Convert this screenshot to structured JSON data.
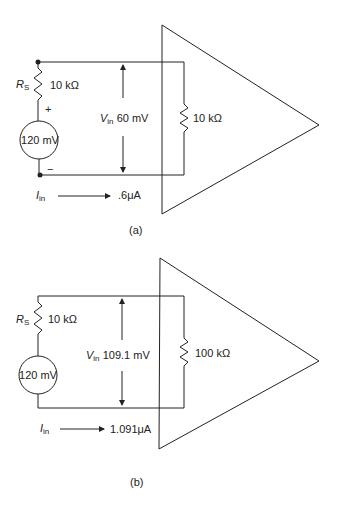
{
  "diagrams": [
    {
      "id": "a",
      "caption": "(a)",
      "source": {
        "label": "120 mV",
        "plus": "+",
        "minus": "−"
      },
      "rs": {
        "symbol": "R",
        "subscript": "S",
        "value": "10 kΩ"
      },
      "vin": {
        "symbol": "V",
        "subscript": "in",
        "value": "60 mV"
      },
      "load": {
        "value": "10 kΩ"
      },
      "iin": {
        "symbol": "I",
        "subscript": "in",
        "value": ".6μA"
      }
    },
    {
      "id": "b",
      "caption": "(b)",
      "source": {
        "label": "120 mV"
      },
      "rs": {
        "symbol": "R",
        "subscript": "S",
        "value": "10 kΩ"
      },
      "vin": {
        "symbol": "V",
        "subscript": "in",
        "value": "109.1 mV"
      },
      "load": {
        "value": "100 kΩ"
      },
      "iin": {
        "symbol": "I",
        "subscript": "in",
        "value": "1.091μA"
      }
    }
  ],
  "colors": {
    "line": "#222222",
    "background": "#ffffff"
  }
}
